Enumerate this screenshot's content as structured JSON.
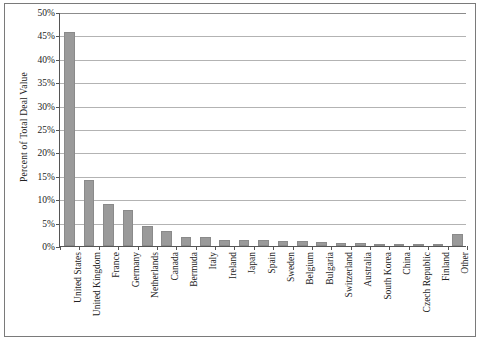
{
  "chart_data": {
    "type": "bar",
    "title": "",
    "xlabel": "",
    "ylabel": "Percent of Total Deal Value",
    "ylim": [
      0,
      50
    ],
    "ytick_step": 5,
    "ytick_labels": [
      "0%",
      "5%",
      "10%",
      "15%",
      "20%",
      "25%",
      "30%",
      "35%",
      "40%",
      "45%",
      "50%"
    ],
    "ytick_values": [
      0,
      5,
      10,
      15,
      20,
      25,
      30,
      35,
      40,
      45,
      50
    ],
    "grid": true,
    "grid_axis": "y",
    "legend": false,
    "bar_color": "#9a9a9a",
    "bar_edge_color": "#8a8a8a",
    "axis_color": "#555555",
    "gridline_color": "#b3b3b3",
    "frame_color": "#7a7a7a",
    "categories": [
      "United States",
      "United Kingdom",
      "France",
      "Germany",
      "Netherlands",
      "Canada",
      "Bermuda",
      "Italy",
      "Ireland",
      "Japan",
      "Spain",
      "Sweden",
      "Belgium",
      "Bulgaria",
      "Switzerland",
      "Australia",
      "South Korea",
      "China",
      "Czech Republic",
      "Finland",
      "Other"
    ],
    "values": [
      45.7,
      14.2,
      9.0,
      7.8,
      4.2,
      3.2,
      2.0,
      2.0,
      1.3,
      1.3,
      1.2,
      1.1,
      1.0,
      0.8,
      0.7,
      0.6,
      0.5,
      0.4,
      0.3,
      0.2,
      2.6
    ]
  }
}
